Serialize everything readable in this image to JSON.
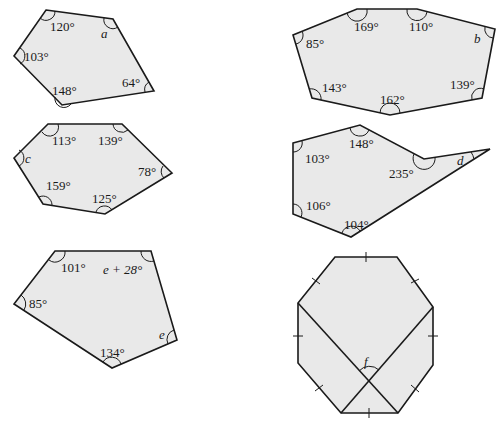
{
  "figures": [
    {
      "id": "pentagon-a",
      "unknown": "a",
      "labels": [
        {
          "text": "120°",
          "x": 50,
          "y": 31
        },
        {
          "text": "a",
          "x": 101,
          "y": 38,
          "italic": true
        },
        {
          "text": "103°",
          "x": 24,
          "y": 61
        },
        {
          "text": "148°",
          "x": 52,
          "y": 95
        },
        {
          "text": "64°",
          "x": 122,
          "y": 87
        }
      ]
    },
    {
      "id": "heptagon-b",
      "unknown": "b",
      "labels": [
        {
          "text": "169°",
          "x": 354,
          "y": 31
        },
        {
          "text": "110°",
          "x": 409,
          "y": 31
        },
        {
          "text": "85°",
          "x": 306,
          "y": 48
        },
        {
          "text": "b",
          "x": 474,
          "y": 43,
          "italic": true
        },
        {
          "text": "143°",
          "x": 322,
          "y": 92
        },
        {
          "text": "162°",
          "x": 380,
          "y": 104
        },
        {
          "text": "139°",
          "x": 450,
          "y": 89
        }
      ]
    },
    {
      "id": "hexagon-c",
      "unknown": "c",
      "labels": [
        {
          "text": "113°",
          "x": 52,
          "y": 145
        },
        {
          "text": "139°",
          "x": 98,
          "y": 145
        },
        {
          "text": "c",
          "x": 25,
          "y": 163,
          "italic": true
        },
        {
          "text": "78°",
          "x": 138,
          "y": 176
        },
        {
          "text": "159°",
          "x": 46,
          "y": 190
        },
        {
          "text": "125°",
          "x": 92,
          "y": 203
        }
      ]
    },
    {
      "id": "hexagon-d",
      "unknown": "d",
      "labels": [
        {
          "text": "148°",
          "x": 349,
          "y": 148
        },
        {
          "text": "103°",
          "x": 305,
          "y": 163
        },
        {
          "text": "235°",
          "x": 389,
          "y": 178
        },
        {
          "text": "d",
          "x": 457,
          "y": 165,
          "italic": true
        },
        {
          "text": "106°",
          "x": 306,
          "y": 210
        },
        {
          "text": "104°",
          "x": 344,
          "y": 229
        }
      ]
    },
    {
      "id": "pentagon-e",
      "unknown": "e",
      "labels": [
        {
          "text": "101°",
          "x": 61,
          "y": 272
        },
        {
          "text": "e + 28°",
          "x": 103,
          "y": 274,
          "italic_prefix": "e"
        },
        {
          "text": "85°",
          "x": 29,
          "y": 308
        },
        {
          "text": "e",
          "x": 159,
          "y": 339,
          "italic": true
        },
        {
          "text": "134°",
          "x": 100,
          "y": 357
        }
      ]
    },
    {
      "id": "regular-octagon-f",
      "unknown": "f",
      "labels": [
        {
          "text": "f",
          "x": 364,
          "y": 366,
          "italic": true
        }
      ]
    }
  ]
}
